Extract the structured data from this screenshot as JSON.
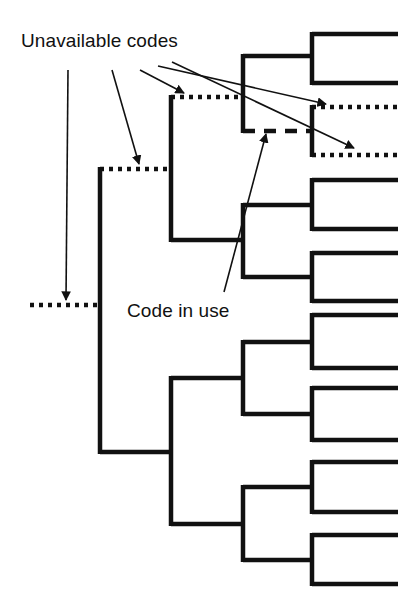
{
  "figure": {
    "type": "binary-code-tree-diagram",
    "background": "#ffffff",
    "width": 405,
    "height": 615,
    "stroke_color": "#111111",
    "labels": [
      {
        "id": "unavailable",
        "text": "Unavailable codes",
        "x": 21,
        "y": 30
      },
      {
        "id": "code-in-use",
        "text": "Code in use",
        "x": 127,
        "y": 300
      }
    ],
    "line_styles": {
      "solid": "Available / unused code branches",
      "dotted": "Unavailable codes",
      "dashed": "Code in use"
    },
    "geometry": {
      "leaf_x_end": 398,
      "leaf_x_start": 312,
      "level3_x": 243,
      "level2_x": 171,
      "level1_x": 100,
      "root_x": 30,
      "leaf_pairs": [
        {
          "id": "pair-1",
          "top_y": 34,
          "bottom_y": 83,
          "center_y": 56,
          "style": "solid"
        },
        {
          "id": "pair-2",
          "top_y": 107,
          "bottom_y": 155,
          "center_y": 131,
          "style": "dotted"
        },
        {
          "id": "pair-3",
          "top_y": 180,
          "bottom_y": 229,
          "center_y": 205,
          "style": "solid"
        },
        {
          "id": "pair-4",
          "top_y": 253,
          "bottom_y": 301,
          "center_y": 277,
          "style": "solid"
        },
        {
          "id": "pair-5",
          "top_y": 315,
          "bottom_y": 368,
          "center_y": 342,
          "style": "solid"
        },
        {
          "id": "pair-6",
          "top_y": 388,
          "bottom_y": 440,
          "center_y": 414,
          "style": "solid"
        },
        {
          "id": "pair-7",
          "top_y": 462,
          "bottom_y": 512,
          "center_y": 487,
          "style": "solid"
        },
        {
          "id": "pair-8",
          "top_y": 535,
          "bottom_y": 584,
          "center_y": 560,
          "style": "solid"
        }
      ],
      "level3_nodes": [
        {
          "id": "n3-a",
          "x": 243,
          "top_y": 56,
          "bottom_y": 131,
          "center_y": 97,
          "top_style": "solid",
          "bottom_style": "dashed"
        },
        {
          "id": "n3-b",
          "x": 243,
          "top_y": 205,
          "bottom_y": 277,
          "center_y": 240,
          "top_style": "solid",
          "bottom_style": "solid"
        },
        {
          "id": "n3-c",
          "x": 243,
          "top_y": 342,
          "bottom_y": 414,
          "center_y": 378,
          "top_style": "solid",
          "bottom_style": "solid"
        },
        {
          "id": "n3-d",
          "x": 243,
          "top_y": 487,
          "bottom_y": 560,
          "center_y": 524,
          "top_style": "solid",
          "bottom_style": "solid"
        }
      ],
      "level2_nodes": [
        {
          "id": "n2-a",
          "x": 171,
          "top_y": 97,
          "bottom_y": 240,
          "center_y": 169,
          "top_style": "dotted",
          "bottom_style": "solid"
        },
        {
          "id": "n2-b",
          "x": 171,
          "top_y": 378,
          "bottom_y": 524,
          "center_y": 452,
          "top_style": "solid",
          "bottom_style": "solid"
        }
      ],
      "level1_nodes": [
        {
          "id": "n1",
          "x": 100,
          "top_y": 169,
          "bottom_y": 452,
          "center_y": 305,
          "top_style": "dotted",
          "bottom_style": "solid"
        }
      ],
      "root": {
        "id": "root",
        "x": 30,
        "y": 305,
        "style": "dotted"
      }
    },
    "annotations": {
      "unavailable_arrows": [
        {
          "from_x": 68,
          "from_y": 70,
          "to_x": 66,
          "to_y": 300,
          "target": "root-dotted-branch"
        },
        {
          "from_x": 110,
          "from_y": 70,
          "to_x": 139,
          "to_y": 164,
          "target": "level1-dotted-branch"
        },
        {
          "from_x": 140,
          "from_y": 70,
          "to_x": 186,
          "to_y": 93,
          "target": "level2-dotted-branch"
        },
        {
          "from_x": 158,
          "from_y": 66,
          "to_x": 327,
          "to_y": 104,
          "target": "leaf-pair-2-top-dotted"
        },
        {
          "from_x": 172,
          "from_y": 62,
          "to_x": 355,
          "to_y": 148,
          "target": "leaf-pair-2-bottom-dotted"
        }
      ],
      "code_in_use_arrow": {
        "from_x": 224,
        "from_y": 292,
        "to_x": 265,
        "to_y": 135,
        "target": "level3-dashed-branch"
      }
    }
  }
}
